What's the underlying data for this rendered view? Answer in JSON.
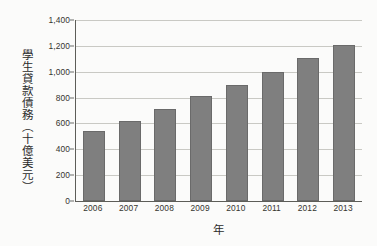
{
  "chart_data": {
    "type": "bar",
    "title": "",
    "xlabel": "年",
    "ylabel": "學生貸款債務（十億美元）",
    "categories": [
      "2006",
      "2007",
      "2008",
      "2009",
      "2010",
      "2011",
      "2012",
      "2013"
    ],
    "values": [
      540,
      620,
      710,
      810,
      900,
      1000,
      1110,
      1210
    ],
    "ylim": [
      0,
      1400
    ],
    "ytick_labels": [
      "0",
      "200",
      "400",
      "600",
      "800",
      "1,000",
      "1,200",
      "1,400"
    ],
    "ytick_values": [
      0,
      200,
      400,
      600,
      800,
      1000,
      1200,
      1400
    ],
    "grid": true,
    "legend": "none",
    "series_color": "#7f7f7f",
    "grid_color": "#c9c9c4",
    "axis_color": "#5d5d58"
  }
}
